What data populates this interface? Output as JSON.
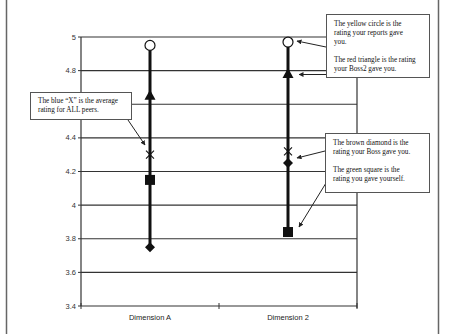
{
  "chart_data": {
    "type": "scatter",
    "subtype": "range-markers",
    "title": "",
    "xlabel": "",
    "ylabel": "",
    "ylim": [
      3.4,
      5
    ],
    "yticks": [
      "5",
      "4.8",
      "4.6",
      "4.4",
      "4.2",
      "4",
      "3.8",
      "3.6",
      "3.4"
    ],
    "ytick_values": [
      5,
      4.8,
      4.6,
      4.4,
      4.2,
      4,
      3.8,
      3.6,
      3.4
    ],
    "grid": true,
    "legend": "none (callout boxes used instead)",
    "categories": [
      "Dimension A",
      "Dimension 2"
    ],
    "series": [
      {
        "name": "Reports (yellow circle)",
        "marker": "circle",
        "values": [
          4.95,
          4.97
        ]
      },
      {
        "name": "Boss2 (red triangle)",
        "marker": "triangle",
        "values": [
          4.65,
          4.78
        ]
      },
      {
        "name": "All peers average (blue X)",
        "marker": "x",
        "values": [
          4.3,
          4.32
        ]
      },
      {
        "name": "Boss (brown diamond)",
        "marker": "diamond",
        "values": [
          3.75,
          4.25
        ]
      },
      {
        "name": "Self (green square)",
        "marker": "square",
        "values": [
          4.15,
          3.84
        ]
      }
    ]
  },
  "callouts": {
    "reports_boss2": {
      "paragraphs": [
        [
          "The yellow circle is the",
          "rating your reports gave",
          "you."
        ],
        [
          "The red triangle is the rating",
          "your Boss2 gave you."
        ]
      ]
    },
    "boss_self": {
      "paragraphs": [
        [
          "The brown diamond is the",
          "rating your Boss gave you."
        ],
        [
          "The green square is the",
          "rating you gave yourself."
        ]
      ]
    },
    "peers": {
      "paragraphs": [
        [
          "The blue “X” is the average",
          "rating for ALL peers."
        ]
      ]
    }
  },
  "colors": {
    "line": "#111111",
    "grid": "#333333",
    "frame": "#666666",
    "circle_fill": "#ffffff"
  }
}
